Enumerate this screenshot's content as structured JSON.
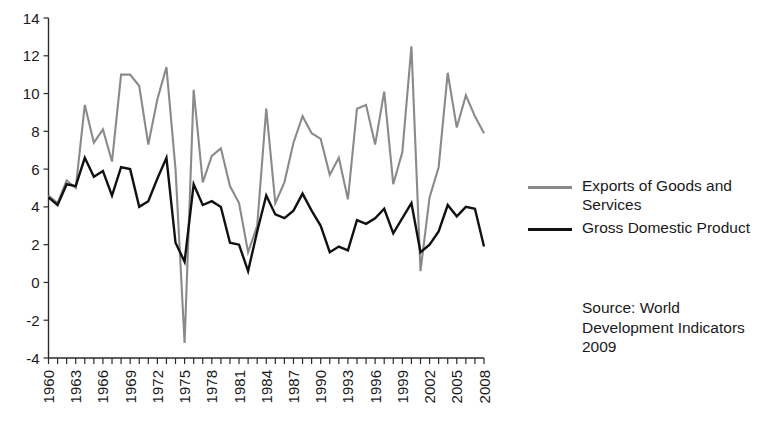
{
  "chart_data": {
    "type": "line",
    "title": "",
    "xlabel": "",
    "ylabel": "",
    "xlim": [
      1960,
      2008
    ],
    "ylim": [
      -4,
      14
    ],
    "ytick_labels": [
      "14",
      "12",
      "10",
      "8",
      "6",
      "4",
      "2",
      "0",
      "-2",
      "-4"
    ],
    "ytick_values": [
      14,
      12,
      10,
      8,
      6,
      4,
      2,
      0,
      -2,
      -4
    ],
    "xtick_labels": [
      "1960",
      "1963",
      "1966",
      "1969",
      "1972",
      "1975",
      "1978",
      "1981",
      "1984",
      "1987",
      "1990",
      "1993",
      "1996",
      "1999",
      "2002",
      "2005",
      "2008"
    ],
    "xtick_values": [
      1960,
      1963,
      1966,
      1969,
      1972,
      1975,
      1978,
      1981,
      1984,
      1987,
      1990,
      1993,
      1996,
      1999,
      2002,
      2005,
      2008
    ],
    "minor_xticks_every": 1,
    "grid": false,
    "legend_position": "right",
    "x": [
      1960,
      1961,
      1962,
      1963,
      1964,
      1965,
      1966,
      1967,
      1968,
      1969,
      1970,
      1971,
      1972,
      1973,
      1974,
      1975,
      1976,
      1977,
      1978,
      1979,
      1980,
      1981,
      1982,
      1983,
      1984,
      1985,
      1986,
      1987,
      1988,
      1989,
      1990,
      1991,
      1992,
      1993,
      1994,
      1995,
      1996,
      1997,
      1998,
      1999,
      2000,
      2001,
      2002,
      2003,
      2004,
      2005,
      2006,
      2007,
      2008
    ],
    "series": [
      {
        "name": "Exports of Goods and Services",
        "color": "#8a8a8a",
        "width": 2.1,
        "values": [
          4.6,
          4.2,
          5.4,
          5.0,
          9.4,
          7.4,
          8.1,
          6.4,
          11.0,
          11.0,
          10.4,
          7.3,
          9.7,
          11.4,
          6.0,
          -3.2,
          10.2,
          5.3,
          6.7,
          7.1,
          5.1,
          4.2,
          1.6,
          3.0,
          9.2,
          4.2,
          5.3,
          7.4,
          8.8,
          7.9,
          7.6,
          5.7,
          6.6,
          4.4,
          9.2,
          9.4,
          7.3,
          10.1,
          5.2,
          6.9,
          12.5,
          0.6,
          4.5,
          6.1,
          11.1,
          8.2,
          9.9,
          8.8,
          7.9
        ]
      },
      {
        "name": "Gross Domestic Product",
        "color": "#111111",
        "width": 2.4,
        "values": [
          4.5,
          4.1,
          5.2,
          5.1,
          6.6,
          5.6,
          5.9,
          4.6,
          6.1,
          6.0,
          4.0,
          4.3,
          5.5,
          6.6,
          2.1,
          1.1,
          5.2,
          4.1,
          4.3,
          4.0,
          2.1,
          2.0,
          0.6,
          2.7,
          4.6,
          3.6,
          3.4,
          3.8,
          4.7,
          3.8,
          3.0,
          1.6,
          1.9,
          1.7,
          3.3,
          3.1,
          3.4,
          3.9,
          2.6,
          3.4,
          4.2,
          1.6,
          2.0,
          2.7,
          4.1,
          3.5,
          4.0,
          3.9,
          1.9
        ]
      }
    ]
  },
  "legend": {
    "items": [
      {
        "label": "Exports of Goods and Services",
        "key": "exports"
      },
      {
        "label": "Gross Domestic Product",
        "key": "gdp"
      }
    ]
  },
  "source_note": "Source: World Development Indicators 2009",
  "colors": {
    "exports_line": "#8a8a8a",
    "gdp_line": "#111111",
    "axis": "#2b2b2b",
    "text": "#1a1a1a",
    "background": "#ffffff"
  }
}
